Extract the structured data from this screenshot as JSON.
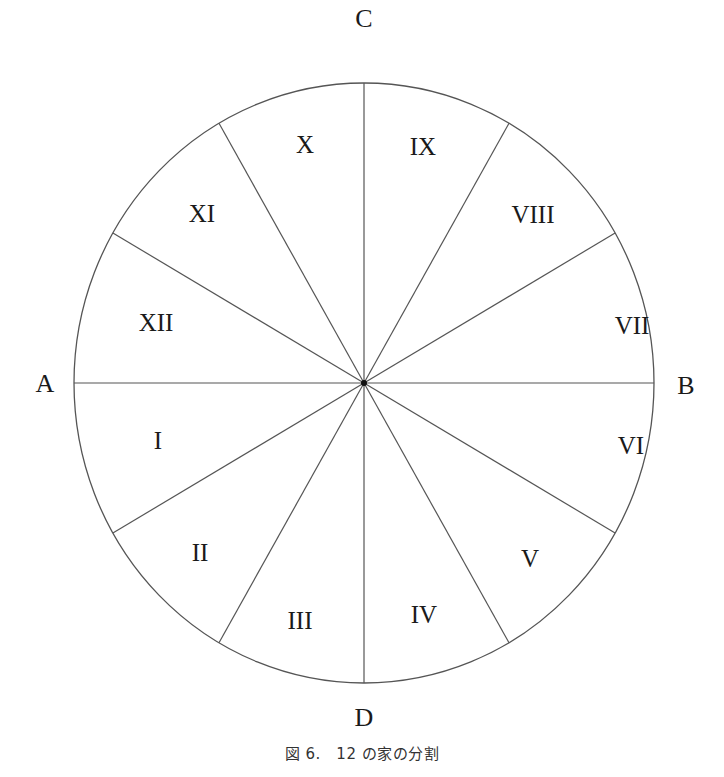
{
  "diagram": {
    "center": {
      "x": 364,
      "y": 383
    },
    "radius_x": 290,
    "radius_y": 300,
    "line_color": "#555555",
    "axis_labels": {
      "top": "C",
      "left": "A",
      "right": "B",
      "bottom": "D"
    },
    "houses": [
      {
        "label": "I",
        "x": 158,
        "y": 440
      },
      {
        "label": "II",
        "x": 200,
        "y": 552
      },
      {
        "label": "III",
        "x": 300,
        "y": 620
      },
      {
        "label": "IV",
        "x": 424,
        "y": 614
      },
      {
        "label": "V",
        "x": 530,
        "y": 558
      },
      {
        "label": "VI",
        "x": 631,
        "y": 445
      },
      {
        "label": "VII",
        "x": 632,
        "y": 325
      },
      {
        "label": "VIII",
        "x": 533,
        "y": 214
      },
      {
        "label": "IX",
        "x": 423,
        "y": 146
      },
      {
        "label": "X",
        "x": 305,
        "y": 144
      },
      {
        "label": "XI",
        "x": 202,
        "y": 213
      },
      {
        "label": "XII",
        "x": 156,
        "y": 322
      }
    ],
    "divisions": 12
  },
  "caption": "図 6.　12 の家の分割"
}
